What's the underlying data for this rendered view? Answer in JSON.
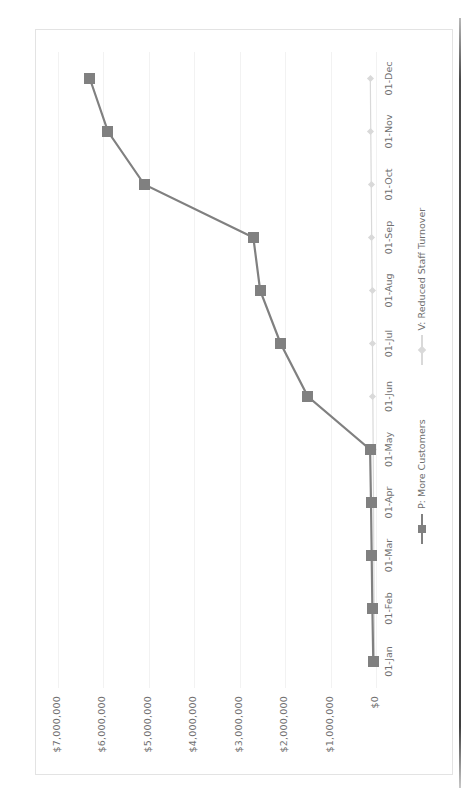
{
  "chart_data": {
    "type": "line",
    "title": "",
    "subtitle": "",
    "xlabel": "",
    "ylabel": "",
    "grid": true,
    "legend_position": "bottom",
    "categories": [
      "01-Jan",
      "01-Feb",
      "01-Mar",
      "01-Apr",
      "01-May",
      "01-Jun",
      "01-Jul",
      "01-Aug",
      "01-Sep",
      "01-Oct",
      "01-Nov",
      "01-Dec"
    ],
    "ytick_labels": [
      "$7,000,000",
      "$6,000,000",
      "$5,000,000",
      "$4,000,000",
      "$3,000,000",
      "$2,000,000",
      "$1,000,000",
      "$0"
    ],
    "ytick_values": [
      7000000,
      6000000,
      5000000,
      4000000,
      3000000,
      2000000,
      1000000,
      0
    ],
    "ylim": [
      0,
      7000000
    ],
    "series": [
      {
        "name": "P: More Customers",
        "color": "#808080",
        "marker": "square",
        "values": [
          60000,
          80000,
          95000,
          110000,
          130000,
          1500000,
          2100000,
          2550000,
          2700000,
          5100000,
          5900000,
          6300000
        ]
      },
      {
        "name": "V: Reduced Staff Turnover",
        "color": "#d9d9d9",
        "marker": "diamond",
        "values": [
          30000,
          40000,
          48000,
          55000,
          62000,
          70000,
          78000,
          85000,
          95000,
          105000,
          115000,
          125000
        ]
      }
    ]
  },
  "legend": {
    "entries": [
      {
        "label": "P: More Customers"
      },
      {
        "label": "V: Reduced Staff Turnover"
      }
    ]
  }
}
